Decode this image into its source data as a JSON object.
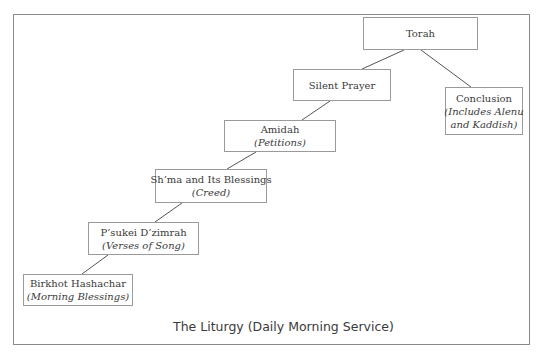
{
  "diagram": {
    "caption": "The Liturgy (Daily Morning Service)",
    "colors": {
      "border": "#9a9a9a",
      "frame": "#8a8a8a",
      "line": "#555555",
      "text": "#3a3a3a",
      "background": "#ffffff"
    },
    "nodes": [
      {
        "id": "torah",
        "title": "Torah",
        "subtitle": ""
      },
      {
        "id": "silent-prayer",
        "title": "Silent Prayer",
        "subtitle": ""
      },
      {
        "id": "conclusion",
        "title": "Conclusion",
        "subtitle": "(Includes Alenu and Kaddish)",
        "subtitle_line1": "(Includes Alenu",
        "subtitle_line2": "and Kaddish)"
      },
      {
        "id": "amidah",
        "title": "Amidah",
        "subtitle": "(Petitions)"
      },
      {
        "id": "shma",
        "title": "Sh’ma and Its Blessings",
        "subtitle": "(Creed)"
      },
      {
        "id": "psukei",
        "title": "P’sukei D’zimrah",
        "subtitle": "(Verses of Song)"
      },
      {
        "id": "birkhot",
        "title": "Birkhot Hashachar",
        "subtitle": "(Morning Blessings)"
      }
    ],
    "edges": [
      {
        "from": "torah",
        "to": "silent-prayer"
      },
      {
        "from": "torah",
        "to": "conclusion"
      },
      {
        "from": "silent-prayer",
        "to": "amidah"
      },
      {
        "from": "amidah",
        "to": "shma"
      },
      {
        "from": "shma",
        "to": "psukei"
      },
      {
        "from": "psukei",
        "to": "birkhot"
      }
    ]
  }
}
